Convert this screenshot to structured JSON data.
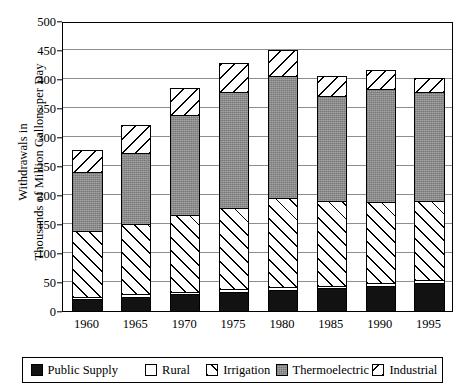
{
  "chart_data": {
    "type": "bar",
    "subtype": "stacked-vertical",
    "title": "",
    "xlabel": "",
    "ylabel_lines": [
      "Withdrawals in",
      "Thousands of Million Gallons per Day"
    ],
    "ylabel": "Withdrawals in Thousands of Million Gallons per Day",
    "categories": [
      "1960",
      "1965",
      "1970",
      "1975",
      "1980",
      "1985",
      "1990",
      "1995"
    ],
    "ylim": [
      0,
      500
    ],
    "yticks": [
      0,
      50,
      100,
      150,
      200,
      250,
      300,
      350,
      400,
      450,
      500
    ],
    "ytick_labels": [
      "0",
      "50",
      "100",
      "150",
      "200",
      "250",
      "300",
      "350",
      "400",
      "450",
      "500"
    ],
    "grid": true,
    "legend_position": "bottom",
    "series": [
      {
        "name": "Public Supply",
        "pattern": "solid-black",
        "color": "#121212",
        "values": [
          21,
          25,
          29,
          33,
          37,
          39,
          43,
          48
        ]
      },
      {
        "name": "Rural",
        "pattern": "solid-white",
        "color": "#ffffff",
        "values": [
          4,
          4,
          4,
          5,
          5,
          5,
          5,
          5
        ]
      },
      {
        "name": "Irrigation",
        "pattern": "diagonal-forward-hatch",
        "color": "#ffffff",
        "values": [
          113,
          121,
          132,
          140,
          153,
          146,
          140,
          137
        ]
      },
      {
        "name": "Thermoelectric",
        "pattern": "solid-gray",
        "color": "#8a8a8a",
        "values": [
          102,
          123,
          173,
          200,
          210,
          180,
          194,
          188
        ]
      },
      {
        "name": "Industrial",
        "pattern": "diagonal-back-hatch",
        "color": "#ffffff",
        "values": [
          38,
          47,
          47,
          49,
          45,
          35,
          33,
          24
        ]
      }
    ],
    "totals": [
      278,
      320,
      385,
      427,
      450,
      405,
      415,
      402
    ],
    "cumulative_tops": [
      [
        21,
        25,
        138,
        240,
        278
      ],
      [
        25,
        29,
        150,
        273,
        320
      ],
      [
        29,
        33,
        165,
        338,
        385
      ],
      [
        33,
        38,
        178,
        378,
        427
      ],
      [
        37,
        42,
        195,
        405,
        450
      ],
      [
        39,
        44,
        190,
        370,
        405
      ],
      [
        43,
        48,
        188,
        382,
        415
      ],
      [
        48,
        53,
        190,
        378,
        402
      ]
    ]
  },
  "legend": {
    "items": [
      {
        "label": "Public Supply"
      },
      {
        "label": "Rural"
      },
      {
        "label": "Irrigation"
      },
      {
        "label": "Thermoelectric"
      },
      {
        "label": "Industrial"
      }
    ]
  }
}
